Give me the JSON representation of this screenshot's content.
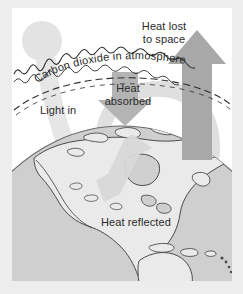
{
  "figure": {
    "type": "diagram",
    "background_color": "#ededed",
    "panel_color": "#ffffff"
  },
  "labels": {
    "heat_lost": "Heat lost\nto space",
    "carbon_dioxide": "Carbon dioxide  in  atmosphere",
    "heat_absorbed": "Heat\nabsorbed",
    "light_in": "Light in",
    "heat_reflected": "Heat reflected"
  },
  "elements": {
    "sun": "sun-circle",
    "light_beam": "light-in-beam",
    "atmosphere_band": "carbon-dioxide-atmosphere-band",
    "up_arrow": "heat-lost-to-space-arrow",
    "down_arrow": "heat-absorbed-arrow",
    "reflected_arrow": "heat-reflected-arrow",
    "swirl_arrow": "circulation-swirl-arrow",
    "globe": "earth-globe-north-america"
  },
  "colors": {
    "arrow_gray": "#a9a9a9",
    "swirl_gray": "#dcdcdc",
    "beam_gray": "#e4e4e4",
    "sun_gray": "#e2e2e2",
    "ocean_gray": "#cfcfcf",
    "land_gray": "#e9e9e9",
    "ink": "#2b2b2b",
    "text": "#2a2a2a"
  }
}
